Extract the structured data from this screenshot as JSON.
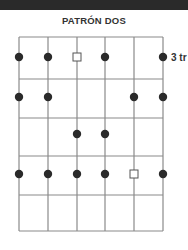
{
  "header": {
    "title": "PATRÓN DOS"
  },
  "diagram": {
    "fret_label": "3 tr",
    "strings_x": [
      19,
      48,
      77,
      105,
      134,
      163
    ],
    "frets_y": [
      37,
      79,
      118,
      156,
      195,
      231
    ],
    "rows_y": [
      57,
      97,
      134,
      174
    ],
    "line_color": "#8a8a8a",
    "dot_color": "#2a2a2a",
    "markers": [
      {
        "row": 0,
        "string": 0,
        "type": "dot"
      },
      {
        "row": 0,
        "string": 1,
        "type": "dot"
      },
      {
        "row": 0,
        "string": 2,
        "type": "square"
      },
      {
        "row": 0,
        "string": 3,
        "type": "dot"
      },
      {
        "row": 0,
        "string": 5,
        "type": "dot"
      },
      {
        "row": 1,
        "string": 0,
        "type": "dot"
      },
      {
        "row": 1,
        "string": 1,
        "type": "dot"
      },
      {
        "row": 1,
        "string": 4,
        "type": "dot"
      },
      {
        "row": 1,
        "string": 5,
        "type": "dot"
      },
      {
        "row": 2,
        "string": 2,
        "type": "dot"
      },
      {
        "row": 2,
        "string": 3,
        "type": "dot"
      },
      {
        "row": 3,
        "string": 0,
        "type": "dot"
      },
      {
        "row": 3,
        "string": 1,
        "type": "dot"
      },
      {
        "row": 3,
        "string": 2,
        "type": "dot"
      },
      {
        "row": 3,
        "string": 3,
        "type": "dot"
      },
      {
        "row": 3,
        "string": 4,
        "type": "square"
      },
      {
        "row": 3,
        "string": 5,
        "type": "dot"
      }
    ]
  }
}
